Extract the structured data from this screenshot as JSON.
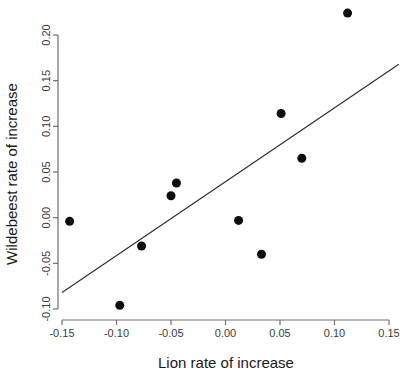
{
  "chart_data": {
    "type": "scatter",
    "title": "",
    "xlabel": "Lion rate of increase",
    "ylabel": "Wildebeest rate of increase",
    "xlim": [
      -0.165,
      0.165
    ],
    "ylim": [
      -0.118,
      0.238
    ],
    "grid": false,
    "legend": null,
    "xticks": [
      -0.15,
      -0.1,
      -0.05,
      0.0,
      0.05,
      0.1,
      0.15
    ],
    "xticklabels": [
      "-0.15",
      "-0.10",
      "-0.05",
      "0.00",
      "0.05",
      "0.10",
      "0.15"
    ],
    "yticks": [
      -0.1,
      -0.05,
      0.0,
      0.05,
      0.1,
      0.15,
      0.2
    ],
    "yticklabels": [
      "-0.10",
      "-0.05",
      "0.00",
      "0.05",
      "0.10",
      "0.15",
      "0.20"
    ],
    "point_color": "#0d0d0d",
    "point_marker": "filled-circle",
    "point_size": 9,
    "points": [
      {
        "x": -0.143,
        "y": -0.004
      },
      {
        "x": -0.097,
        "y": -0.096
      },
      {
        "x": -0.077,
        "y": -0.031
      },
      {
        "x": -0.05,
        "y": 0.024
      },
      {
        "x": -0.045,
        "y": 0.038
      },
      {
        "x": 0.012,
        "y": -0.003
      },
      {
        "x": 0.033,
        "y": -0.04
      },
      {
        "x": 0.051,
        "y": 0.114
      },
      {
        "x": 0.07,
        "y": 0.065
      },
      {
        "x": 0.112,
        "y": 0.224
      }
    ],
    "series": [
      {
        "name": "regression-line",
        "type": "line",
        "color": "#2a2a2a",
        "x": [
          -0.15,
          0.159
        ],
        "y": [
          -0.082,
          0.168
        ]
      }
    ]
  }
}
